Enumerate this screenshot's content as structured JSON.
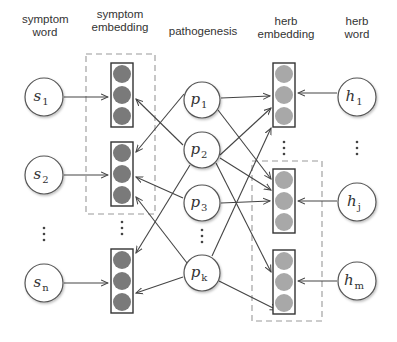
{
  "column_headers": [
    {
      "id": "symptom-word",
      "text": "symptom\nword",
      "x": 22,
      "y": 13,
      "w": 46
    },
    {
      "id": "symptom-embedding",
      "text": "symptom\nembedding",
      "x": 85,
      "y": 8,
      "w": 70
    },
    {
      "id": "pathogenesis",
      "text": "pathogenesis",
      "x": 163,
      "y": 25,
      "w": 80
    },
    {
      "id": "herb-embedding",
      "text": "herb\nembedding",
      "x": 251,
      "y": 15,
      "w": 70
    },
    {
      "id": "herb-word",
      "text": "herb\nword",
      "x": 337,
      "y": 15,
      "w": 40
    }
  ],
  "symptom_nodes": [
    {
      "id": "s1",
      "base": "s",
      "sub": "1",
      "cx": 44,
      "cy": 97
    },
    {
      "id": "s2",
      "base": "s",
      "sub": "2",
      "cx": 44,
      "cy": 175
    },
    {
      "id": "sn",
      "base": "s",
      "sub": "n",
      "cx": 44,
      "cy": 283
    }
  ],
  "pathogenesis_nodes": [
    {
      "id": "p1",
      "base": "p",
      "sub": "1",
      "cx": 202,
      "cy": 100
    },
    {
      "id": "p2",
      "base": "p",
      "sub": "2",
      "cx": 202,
      "cy": 150
    },
    {
      "id": "p3",
      "base": "p",
      "sub": "3",
      "cx": 202,
      "cy": 203
    },
    {
      "id": "pk",
      "base": "p",
      "sub": "k",
      "cx": 202,
      "cy": 273
    }
  ],
  "herb_nodes": [
    {
      "id": "h1",
      "base": "h",
      "sub": "1",
      "cx": 357,
      "cy": 97
    },
    {
      "id": "hj",
      "base": "h",
      "sub": "j",
      "cx": 357,
      "cy": 202
    },
    {
      "id": "hm",
      "base": "h",
      "sub": "m",
      "cx": 357,
      "cy": 281
    }
  ],
  "symptom_embeddings": [
    {
      "id": "se1",
      "x": 111,
      "y": 63,
      "w": 22,
      "h": 64
    },
    {
      "id": "se2",
      "x": 111,
      "y": 142,
      "w": 22,
      "h": 64
    },
    {
      "id": "sen",
      "x": 111,
      "y": 249,
      "w": 22,
      "h": 64
    }
  ],
  "herb_embeddings": [
    {
      "id": "he1",
      "x": 273,
      "y": 63,
      "w": 22,
      "h": 64
    },
    {
      "id": "hej",
      "x": 273,
      "y": 169,
      "w": 22,
      "h": 64
    },
    {
      "id": "hem",
      "x": 273,
      "y": 250,
      "w": 22,
      "h": 64
    }
  ],
  "dashed_groups": [
    {
      "id": "symptom-group",
      "x": 86,
      "y": 54,
      "w": 69,
      "h": 160
    },
    {
      "id": "herb-group",
      "x": 252,
      "y": 161,
      "w": 70,
      "h": 160
    }
  ],
  "ellipses": [
    {
      "id": "s-ellipsis",
      "x": 44,
      "y": 234
    },
    {
      "id": "se-ellipsis",
      "x": 122,
      "y": 228
    },
    {
      "id": "p-ellipsis",
      "x": 202,
      "y": 236
    },
    {
      "id": "he-ellipsis",
      "x": 284,
      "y": 148
    },
    {
      "id": "h-ellipsis",
      "x": 357,
      "y": 148
    }
  ],
  "edges": [
    {
      "from": "s1",
      "to": "se1",
      "x1": 64,
      "y1": 97,
      "x2": 108,
      "y2": 97
    },
    {
      "from": "s2",
      "to": "se2",
      "x1": 64,
      "y1": 175,
      "x2": 108,
      "y2": 175
    },
    {
      "from": "sn",
      "to": "sen",
      "x1": 64,
      "y1": 283,
      "x2": 108,
      "y2": 283
    },
    {
      "from": "h1",
      "to": "he1",
      "x1": 337,
      "y1": 93,
      "x2": 298,
      "y2": 93
    },
    {
      "from": "hj",
      "to": "hej",
      "x1": 337,
      "y1": 201,
      "x2": 298,
      "y2": 201
    },
    {
      "from": "hm",
      "to": "hem",
      "x1": 337,
      "y1": 281,
      "x2": 298,
      "y2": 281
    },
    {
      "from": "p1",
      "to": "se2",
      "x1": 184,
      "y1": 94,
      "x2": 136,
      "y2": 152
    },
    {
      "from": "p1",
      "to": "he1",
      "x1": 221,
      "y1": 98,
      "x2": 270,
      "y2": 96
    },
    {
      "from": "p1",
      "to": "hej",
      "x1": 218,
      "y1": 110,
      "x2": 271,
      "y2": 179
    },
    {
      "from": "p2",
      "to": "se1",
      "x1": 183,
      "y1": 145,
      "x2": 136,
      "y2": 99
    },
    {
      "from": "p2",
      "to": "sen",
      "x1": 190,
      "y1": 165,
      "x2": 136,
      "y2": 253
    },
    {
      "from": "p2",
      "to": "he1",
      "x1": 220,
      "y1": 155,
      "x2": 271,
      "y2": 108
    },
    {
      "from": "p2",
      "to": "hej",
      "x1": 220,
      "y1": 158,
      "x2": 271,
      "y2": 190
    },
    {
      "from": "p2",
      "to": "hem",
      "x1": 216,
      "y1": 163,
      "x2": 271,
      "y2": 272
    },
    {
      "from": "p3",
      "to": "se2",
      "x1": 183,
      "y1": 198,
      "x2": 136,
      "y2": 177
    },
    {
      "from": "p3",
      "to": "hej",
      "x1": 221,
      "y1": 203,
      "x2": 270,
      "y2": 201
    },
    {
      "from": "pk",
      "to": "se2",
      "x1": 187,
      "y1": 263,
      "x2": 136,
      "y2": 197
    },
    {
      "from": "pk",
      "to": "sen",
      "x1": 183,
      "y1": 277,
      "x2": 136,
      "y2": 293
    },
    {
      "from": "pk",
      "to": "he1",
      "x1": 212,
      "y1": 256,
      "x2": 271,
      "y2": 128
    },
    {
      "from": "pk",
      "to": "hem",
      "x1": 219,
      "y1": 281,
      "x2": 277,
      "y2": 310
    }
  ],
  "colors": {
    "symptom_dot": "#7a7a7a",
    "herb_dot": "#a8a8a8",
    "box_stroke": "#333333",
    "dashed_stroke": "#999999",
    "edge": "#444444",
    "node_stroke": "#555555",
    "node_fill": "#ffffff"
  }
}
